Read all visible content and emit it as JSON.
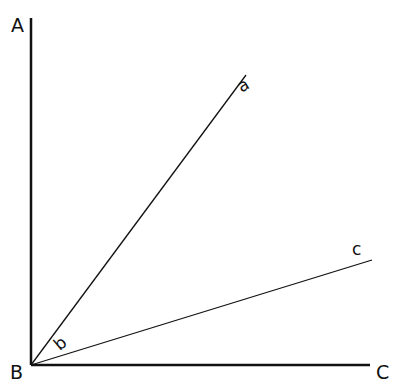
{
  "diagram": {
    "type": "angle-diagram",
    "vertex": "B",
    "labels": {
      "A": "A",
      "B": "B",
      "C": "C",
      "a": "a",
      "b": "b",
      "c": "c"
    },
    "lines": [
      {
        "name": "BA",
        "from": [
          31,
          365
        ],
        "to": [
          31,
          18
        ]
      },
      {
        "name": "BC",
        "from": [
          31,
          365
        ],
        "to": [
          370,
          365
        ]
      },
      {
        "name": "Ba",
        "from": [
          31,
          365
        ],
        "to": [
          246,
          75
        ]
      },
      {
        "name": "Bc",
        "from": [
          31,
          365
        ],
        "to": [
          372,
          260
        ]
      }
    ],
    "colors": {
      "line": "#111111",
      "background": "#ffffff"
    }
  }
}
